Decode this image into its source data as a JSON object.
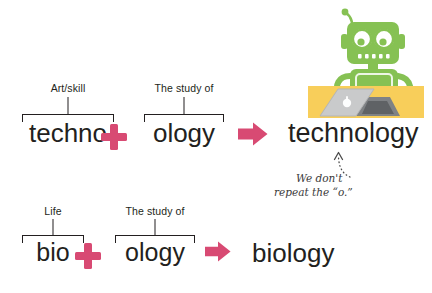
{
  "colors": {
    "pink": "#d84a73",
    "ink": "#231f20",
    "robot_green": "#86c153",
    "robot_green_dark": "#6aa83f",
    "desk_yellow": "#f8ce5a",
    "laptop_gray": "#c9cacb",
    "note_gray": "#3a3a3a"
  },
  "rows": [
    {
      "id": "technology",
      "parts": [
        {
          "label": "Art/skill",
          "word": "techno"
        },
        {
          "label": "The study of",
          "word": "ology"
        }
      ],
      "operator": "+",
      "arrow": "right-arrow",
      "result": "technology"
    },
    {
      "id": "biology",
      "parts": [
        {
          "label": "Life",
          "word": "bio"
        },
        {
          "label": "The study of",
          "word": "ology"
        }
      ],
      "operator": "+",
      "arrow": "right-arrow",
      "result": "biology"
    }
  ],
  "annotation": {
    "line1": "We don't",
    "line2": "repeat the “o.”"
  },
  "illustration": {
    "name": "robot-at-laptop",
    "alt": "Green robot sitting at a yellow desk using a laptop"
  }
}
